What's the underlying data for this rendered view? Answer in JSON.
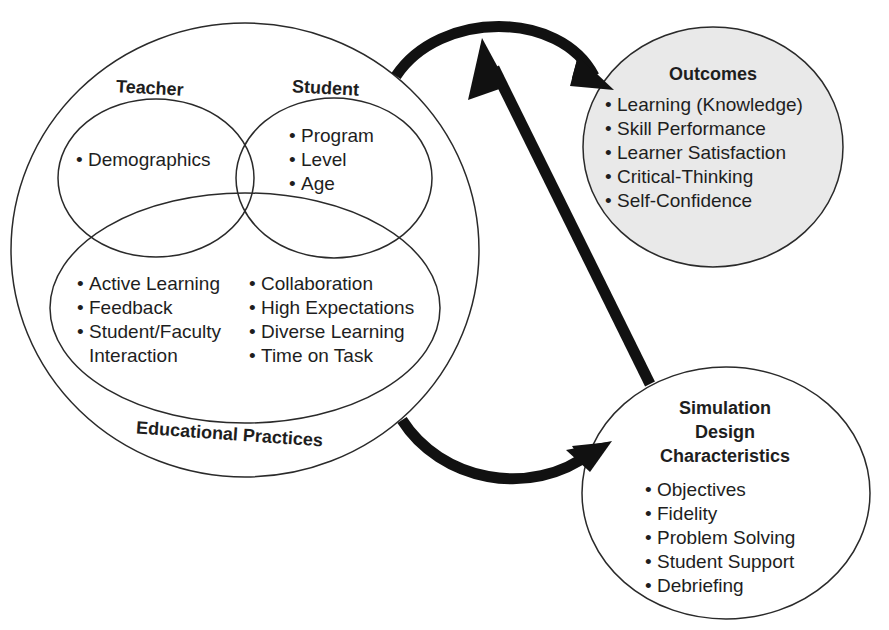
{
  "diagram": {
    "type": "conceptual-framework",
    "colors": {
      "stroke": "#2a2a2a",
      "arrow": "#111111",
      "outcomes_fill": "#e9e9e9",
      "background": "#ffffff"
    },
    "bullet": "•",
    "main_circle": {
      "teacher": {
        "title": "Teacher",
        "items": [
          "Demographics"
        ]
      },
      "student": {
        "title": "Student",
        "items": [
          "Program",
          "Level",
          "Age"
        ]
      },
      "educational_practices": {
        "title": "Educational Practices",
        "left_items": [
          "Active Learning",
          "Feedback",
          "Student/Faculty",
          "Interaction"
        ],
        "right_items": [
          "Collaboration",
          "High Expectations",
          "Diverse Learning",
          "Time on Task"
        ]
      }
    },
    "outcomes": {
      "title": "Outcomes",
      "items": [
        "Learning (Knowledge)",
        "Skill Performance",
        "Learner Satisfaction",
        "Critical-Thinking",
        "Self-Confidence"
      ]
    },
    "simulation_design": {
      "title_lines": [
        "Simulation",
        "Design",
        "Characteristics"
      ],
      "items": [
        "Objectives",
        "Fidelity",
        "Problem Solving",
        "Student Support",
        "Debriefing"
      ]
    },
    "arrows": [
      {
        "from": "main_circle",
        "to": "outcomes"
      },
      {
        "from": "simulation_design",
        "to": "outcomes"
      },
      {
        "from": "main_circle",
        "to": "simulation_design"
      }
    ]
  }
}
